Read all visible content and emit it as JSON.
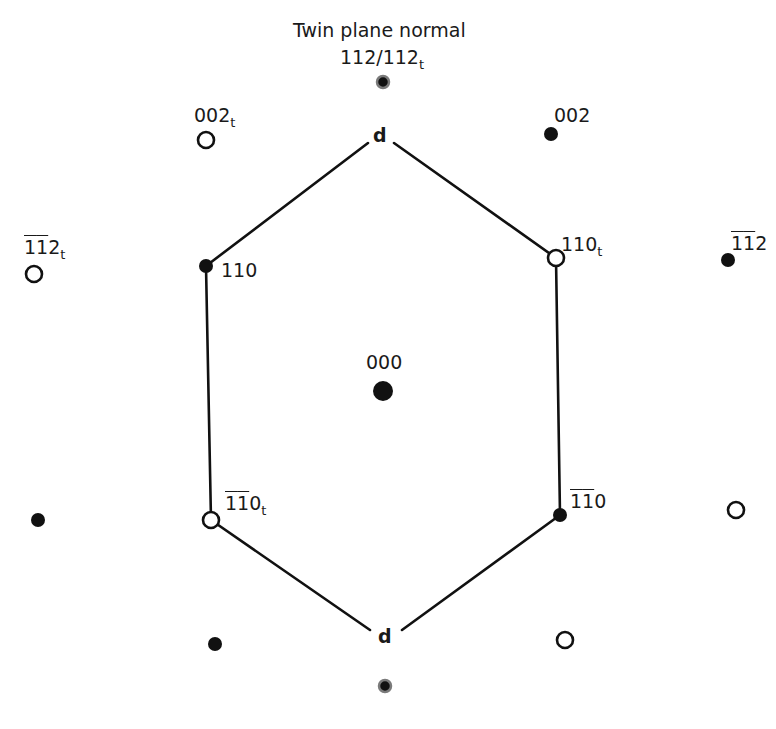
{
  "title": {
    "line1": "Twin plane normal",
    "line2_main": "112/112",
    "line2_sub": "t"
  },
  "hexagon": {
    "vertex_label_top": "d",
    "vertex_label_bottom": "d",
    "vertices": [
      [
        380,
        140
      ],
      [
        556,
        258
      ],
      [
        560,
        515
      ],
      [
        384,
        634
      ],
      [
        211,
        520
      ],
      [
        206,
        266
      ]
    ]
  },
  "spots": [
    {
      "id": "twin-normal-top",
      "x": 383,
      "y": 82,
      "r": 7,
      "type": "filled-ringed"
    },
    {
      "id": "twin-normal-bottom",
      "x": 385,
      "y": 686,
      "r": 7,
      "type": "filled-ringed"
    },
    {
      "id": "000",
      "x": 383,
      "y": 391,
      "r": 10,
      "type": "filled"
    },
    {
      "id": "002t",
      "x": 206,
      "y": 140,
      "r": 8,
      "type": "open"
    },
    {
      "id": "002",
      "x": 551,
      "y": 134,
      "r": 7,
      "type": "filled"
    },
    {
      "id": "-1-12t",
      "x": 34,
      "y": 274,
      "r": 8,
      "type": "open"
    },
    {
      "id": "-1-12",
      "x": 728,
      "y": 260,
      "r": 7,
      "type": "filled"
    },
    {
      "id": "110",
      "x": 206,
      "y": 266,
      "r": 7,
      "type": "filled"
    },
    {
      "id": "110t",
      "x": 556,
      "y": 258,
      "r": 8,
      "type": "open"
    },
    {
      "id": "-1-10t",
      "x": 211,
      "y": 520,
      "r": 8,
      "type": "open"
    },
    {
      "id": "-1-10",
      "x": 560,
      "y": 515,
      "r": 7,
      "type": "filled"
    },
    {
      "id": "left-unlabeled",
      "x": 38,
      "y": 520,
      "r": 7,
      "type": "filled"
    },
    {
      "id": "right-unlabeled",
      "x": 736,
      "y": 510,
      "r": 8,
      "type": "open"
    },
    {
      "id": "bottom-left-unlabeled",
      "x": 215,
      "y": 644,
      "r": 7,
      "type": "filled"
    },
    {
      "id": "bottom-right-unlabeled",
      "x": 565,
      "y": 640,
      "r": 8,
      "type": "open"
    }
  ],
  "labels": {
    "l000": {
      "main": "000"
    },
    "l002t": {
      "main": "002",
      "sub": "t"
    },
    "l002": {
      "main": "002"
    },
    "l112t": {
      "bar": "1",
      "bar2": "1",
      "rest": "2",
      "sub": "t"
    },
    "l112": {
      "bar": "1",
      "bar2": "1",
      "rest": "2"
    },
    "l110": {
      "main": "110"
    },
    "l110t": {
      "main": "110",
      "sub": "t"
    },
    "l110bt": {
      "bar": "1",
      "bar2": "1",
      "rest": "0",
      "sub": "t"
    },
    "l110b": {
      "bar": "1",
      "bar2": "1",
      "rest": "0"
    }
  },
  "colors": {
    "ink": "#111111",
    "ring": "#7a7a7a",
    "background": "#ffffff"
  }
}
